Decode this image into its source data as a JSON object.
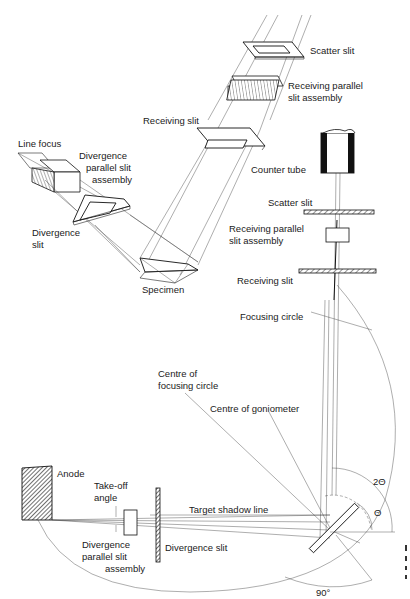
{
  "figure": {
    "top_view": {
      "labels": {
        "scatter_slit": "Scatter slit",
        "receiving_parallel_1": "Receiving parallel",
        "receiving_parallel_2": "slit assembly",
        "receiving_slit": "Receiving slit",
        "line_focus": "Line focus",
        "divergence_parallel_1": "Divergence",
        "divergence_parallel_2": "parallel slit",
        "divergence_parallel_3": "assembly",
        "divergence_slit_1": "Divergence",
        "divergence_slit_2": "slit",
        "specimen": "Specimen"
      }
    },
    "side_view": {
      "labels": {
        "counter_tube": "Counter tube",
        "scatter_slit": "Scatter slit",
        "receiving_parallel_1": "Receiving parallel",
        "receiving_parallel_2": "slit assembly",
        "receiving_slit": "Receiving slit",
        "focusing_circle": "Focusing circle",
        "centre_focusing_1": "Centre of",
        "centre_focusing_2": "focusing circle",
        "centre_goniometer": "Centre of goniometer",
        "anode": "Anode",
        "takeoff_1": "Take-off",
        "takeoff_2": "angle",
        "target_shadow": "Target shadow line",
        "div_parallel_1": "Divergence",
        "div_parallel_2": "parallel slit",
        "div_parallel_3": "assembly",
        "divergence_slit": "Divergence slit",
        "two_theta": "2Θ",
        "theta": "Θ",
        "ninety": "90°"
      }
    }
  }
}
